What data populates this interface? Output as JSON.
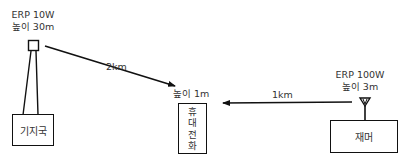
{
  "base_station": {
    "erp": "ERP 10W",
    "height": "높이 30m",
    "label": "기지국"
  },
  "phone": {
    "height": "높이 1m",
    "label_chars": [
      "휴",
      "대",
      "전",
      "화"
    ]
  },
  "jammer": {
    "erp": "ERP 100W",
    "height": "높이 3m",
    "label": "재머"
  },
  "links": {
    "base_to_phone": "2km",
    "jammer_to_phone": "1km"
  },
  "colors": {
    "line": "#111111",
    "text": "#333333",
    "background": "#ffffff"
  }
}
